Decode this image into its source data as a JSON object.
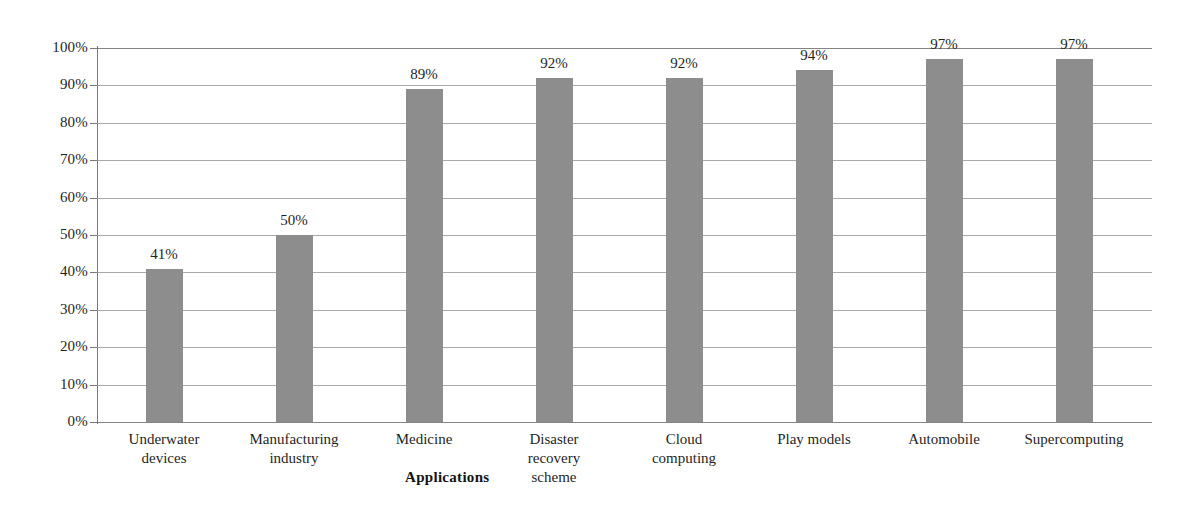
{
  "chart_data": {
    "type": "bar",
    "title": "",
    "subtitle": "",
    "xlabel": "Applications",
    "ylabel": "",
    "categories": [
      "Underwater devices",
      "Manufacturing industry",
      "Medicine",
      "Disaster recovery scheme",
      "Cloud computing",
      "Play models",
      "Automobile",
      "Supercomputing"
    ],
    "category_lines": [
      [
        "Underwater",
        "devices"
      ],
      [
        "Manufacturing",
        "industry"
      ],
      [
        "Medicine"
      ],
      [
        "Disaster",
        "recovery",
        "scheme"
      ],
      [
        "Cloud",
        "computing"
      ],
      [
        "Play models"
      ],
      [
        "Automobile"
      ],
      [
        "Supercomputing"
      ]
    ],
    "values": [
      41,
      50,
      89,
      92,
      92,
      94,
      97,
      97
    ],
    "value_labels": [
      "41%",
      "50%",
      "89%",
      "92%",
      "92%",
      "94%",
      "97%",
      "97%"
    ],
    "ylim": [
      0,
      100
    ],
    "ytick_values": [
      0,
      10,
      20,
      30,
      40,
      50,
      60,
      70,
      80,
      90,
      100
    ],
    "ytick_labels": [
      "0%",
      "10%",
      "20%",
      "30%",
      "40%",
      "50%",
      "60%",
      "70%",
      "80%",
      "90%",
      "100%"
    ],
    "grid": true,
    "grid_axis": "y",
    "legend": false,
    "legend_position": "none",
    "bar_color": "#8d8d8d",
    "gridline_color": "#9a9a9a",
    "axis_color": "#7a7a7a",
    "text_color": "#1f1f1f",
    "background_color": "#ffffff"
  }
}
